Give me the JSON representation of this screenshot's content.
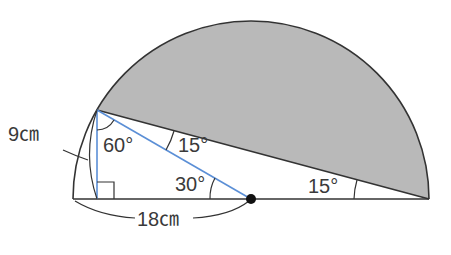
{
  "figure": {
    "type": "geometry",
    "colors": {
      "shade": "#b9b9b9",
      "outline": "#333333",
      "blue_line": "#5b8fd6",
      "text": "#3a3a3a",
      "center_dot": "#111111"
    }
  },
  "labels": {
    "radius_label": "18㎝",
    "height_label": "9㎝",
    "angle_vertex": "60°",
    "angle_between": "15°",
    "angle_center": "30°",
    "angle_right_end": "15°"
  }
}
